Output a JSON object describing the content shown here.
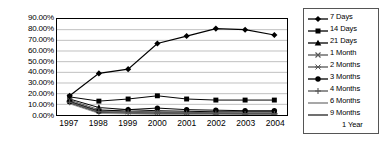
{
  "chart_data": {
    "type": "line",
    "title": "",
    "subtitle": "",
    "xlabel": "",
    "ylabel": "",
    "grid": true,
    "grid_axis": "y",
    "legend_position": "right",
    "legend_border": true,
    "xlim": [
      "1997",
      "2004"
    ],
    "ylim": [
      0,
      90
    ],
    "ytick_step": 10,
    "ytick_format": "0.00%",
    "categories": [
      "1997",
      "1998",
      "1999",
      "2000",
      "2001",
      "2002",
      "2003",
      "2004"
    ],
    "x_tick_labels": [
      "1997",
      "1998",
      "1999",
      "2000",
      "2001",
      "2002",
      "2003",
      "2004"
    ],
    "y_tick_labels": [
      "0.00%",
      "10.00%",
      "20.00%",
      "30.00%",
      "40.00%",
      "50.00%",
      "60.00%",
      "70.00%",
      "80.00%",
      "90.00%"
    ],
    "y_tick_values": [
      0,
      10,
      20,
      30,
      40,
      50,
      60,
      70,
      80,
      90
    ],
    "series": [
      {
        "name": "7 Days",
        "marker": "diamond",
        "color": "#000000",
        "values": [
          18.0,
          39.0,
          43.0,
          67.0,
          74.0,
          81.0,
          80.0,
          75.0
        ]
      },
      {
        "name": "14 Days",
        "marker": "square",
        "color": "#000000",
        "values": [
          17.0,
          13.0,
          15.0,
          18.0,
          15.0,
          14.0,
          14.0,
          14.0
        ]
      },
      {
        "name": "21 Days",
        "marker": "triangle",
        "color": "#000000",
        "values": [
          15.0,
          7.0,
          5.0,
          4.0,
          3.5,
          3.0,
          3.0,
          3.0
        ]
      },
      {
        "name": "1 Month",
        "marker": "x",
        "color": "#555555",
        "values": [
          14.0,
          5.0,
          3.5,
          3.0,
          2.5,
          2.0,
          2.0,
          2.0
        ]
      },
      {
        "name": "2 Months",
        "marker": "star",
        "color": "#555555",
        "values": [
          13.0,
          4.0,
          3.0,
          2.5,
          2.0,
          2.0,
          1.5,
          1.5
        ]
      },
      {
        "name": "3 Months",
        "marker": "circle",
        "color": "#000000",
        "values": [
          12.5,
          3.5,
          5.0,
          6.5,
          5.0,
          4.5,
          4.0,
          4.0
        ]
      },
      {
        "name": "4 Months",
        "marker": "plus",
        "color": "#555555",
        "values": [
          12.0,
          3.0,
          2.5,
          2.0,
          1.5,
          1.5,
          1.0,
          1.0
        ]
      },
      {
        "name": "6 Months",
        "marker": "none",
        "color": "#777777",
        "values": [
          11.5,
          2.5,
          2.0,
          1.5,
          1.0,
          1.0,
          1.0,
          1.0
        ]
      },
      {
        "name": "9 Months",
        "marker": "none",
        "color": "#222222",
        "values": [
          11.0,
          2.0,
          1.5,
          1.0,
          1.0,
          0.8,
          0.8,
          0.8
        ]
      },
      {
        "name": "1 Year",
        "marker": "none",
        "color": "#ffffff",
        "values": [
          10.5,
          1.5,
          1.0,
          0.8,
          0.5,
          0.5,
          0.5,
          0.5
        ]
      }
    ]
  },
  "colors": {
    "plot_border": "#000000",
    "gridline": "#b8b8b8",
    "legend_border": "#555555",
    "background": "#ffffff",
    "text": "#000000"
  }
}
